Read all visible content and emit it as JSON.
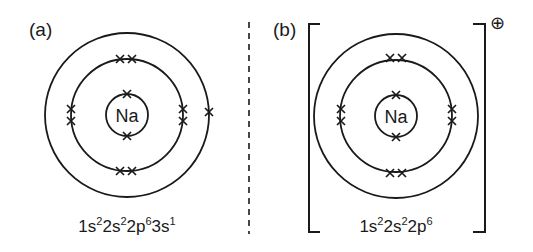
{
  "panels": [
    {
      "label": "(a)",
      "element": "Na",
      "configuration": [
        {
          "base": "1s",
          "sup": "2"
        },
        {
          "base": "2s",
          "sup": "2"
        },
        {
          "base": "2p",
          "sup": "6"
        },
        {
          "base": "3s",
          "sup": "1"
        }
      ],
      "shells": [
        {
          "name": "shell-1",
          "electrons": 2
        },
        {
          "name": "shell-2",
          "electrons": 8
        },
        {
          "name": "shell-3",
          "electrons": 1
        }
      ],
      "charge": ""
    },
    {
      "label": "(b)",
      "element": "Na",
      "configuration": [
        {
          "base": "1s",
          "sup": "2"
        },
        {
          "base": "2s",
          "sup": "2"
        },
        {
          "base": "2p",
          "sup": "6"
        }
      ],
      "shells": [
        {
          "name": "shell-1",
          "electrons": 2
        },
        {
          "name": "shell-2",
          "electrons": 8
        },
        {
          "name": "shell-3",
          "electrons": 0
        }
      ],
      "charge": "⊕"
    }
  ],
  "electron_symbol": "x",
  "divider": "dashed",
  "colors": {
    "ink": "#1a1a1a",
    "background": "#ffffff"
  }
}
